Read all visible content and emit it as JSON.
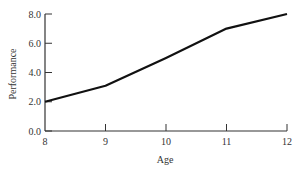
{
  "chart_data": {
    "type": "line",
    "title": "",
    "xlabel": "Age",
    "ylabel": "Performance",
    "x": [
      8,
      9,
      10,
      11,
      12
    ],
    "series": [
      {
        "name": "Performance",
        "values": [
          2.0,
          3.1,
          5.0,
          7.0,
          8.0
        ],
        "color": "#111111"
      }
    ],
    "x_ticks": [
      "8",
      "9",
      "10",
      "11",
      "12"
    ],
    "y_ticks": [
      "0.0",
      "2.0",
      "4.0",
      "6.0",
      "8.0"
    ],
    "xlim": [
      8,
      12
    ],
    "ylim": [
      0,
      8
    ],
    "grid": false,
    "legend": "none"
  }
}
